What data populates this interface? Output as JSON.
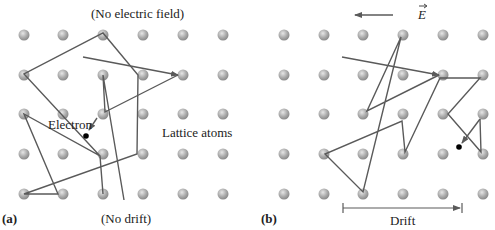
{
  "panel_a": {
    "tag": "(a)",
    "title": "(No electric field)",
    "caption": "(No drift)",
    "electron_label": "Electron",
    "lattice_label": "Lattice atoms"
  },
  "panel_b": {
    "tag": "(b)",
    "field_label": "E",
    "drift_label": "Drift"
  },
  "colors": {
    "atom": "#a8a8a8",
    "path": "#5a5a5a",
    "electron": "#000000",
    "text": "#222222"
  }
}
